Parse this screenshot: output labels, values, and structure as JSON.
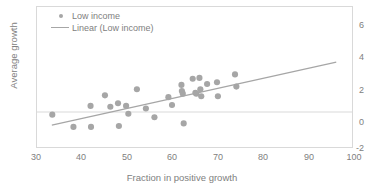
{
  "chart_data": {
    "type": "scatter",
    "title": "",
    "xlabel": "Fraction in positive growth",
    "ylabel": "Average growth",
    "xlim": [
      30,
      100
    ],
    "ylim": [
      -2,
      6
    ],
    "xticks": [
      30,
      40,
      50,
      60,
      70,
      80,
      90,
      100
    ],
    "yticks": [
      -2,
      0,
      2,
      4,
      6
    ],
    "grid": false,
    "legend_position": "top-left",
    "series": [
      {
        "name": "Low income",
        "type": "scatter",
        "marker": "circle",
        "color": "#a6a6a6",
        "points": [
          [
            33.4,
            -0.15
          ],
          [
            38.1,
            -0.85
          ],
          [
            41.9,
            0.35
          ],
          [
            42.0,
            -0.85
          ],
          [
            45.1,
            0.95
          ],
          [
            46.3,
            0.3
          ],
          [
            48.0,
            0.5
          ],
          [
            48.2,
            -0.8
          ],
          [
            49.8,
            0.35
          ],
          [
            50.3,
            -0.1
          ],
          [
            52.2,
            1.3
          ],
          [
            54.2,
            0.2
          ],
          [
            56.1,
            -0.3
          ],
          [
            59.2,
            0.85
          ],
          [
            60.0,
            0.4
          ],
          [
            62.1,
            1.55
          ],
          [
            62.2,
            1.2
          ],
          [
            62.4,
            1.05
          ],
          [
            62.6,
            -0.65
          ],
          [
            64.6,
            1.9
          ],
          [
            65.2,
            1.1
          ],
          [
            65.4,
            1.05
          ],
          [
            66.1,
            1.95
          ],
          [
            66.3,
            1.3
          ],
          [
            66.5,
            0.9
          ],
          [
            67.8,
            1.6
          ],
          [
            70.0,
            1.7
          ],
          [
            70.2,
            0.9
          ],
          [
            74.0,
            2.15
          ],
          [
            74.3,
            1.45
          ]
        ]
      },
      {
        "name": "Linear (Low income)",
        "type": "line",
        "color": "#a6a6a6",
        "endpoints": [
          [
            33.3,
            -0.75
          ],
          [
            96.5,
            2.85
          ]
        ]
      }
    ]
  },
  "legend": {
    "items": [
      {
        "label": "Low income",
        "key": "marker"
      },
      {
        "label": "Linear (Low income)",
        "key": "line"
      }
    ]
  },
  "axes": {
    "x_title": "Fraction in positive growth",
    "y_title": "Average growth",
    "x_tick_labels": [
      "30",
      "40",
      "50",
      "60",
      "70",
      "80",
      "90",
      "100"
    ],
    "y_tick_labels": [
      "-2",
      "0",
      "2",
      "4",
      "6"
    ]
  },
  "colors": {
    "marker": "#a6a6a6",
    "trendline": "#a6a6a6",
    "frame": "#d9d9d9",
    "text": "#808080"
  }
}
